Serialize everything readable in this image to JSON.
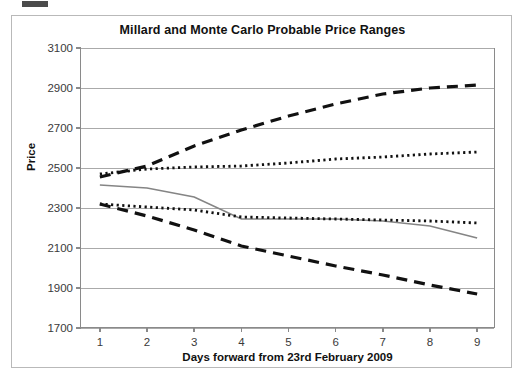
{
  "chart_data": {
    "type": "line",
    "title": "Millard and Monte Carlo Probable Price Ranges",
    "xlabel": "Days forward from 23rd February 2009",
    "ylabel": "Price",
    "x": [
      1,
      2,
      3,
      4,
      5,
      6,
      7,
      8,
      9
    ],
    "xlim": [
      0.6,
      9.4
    ],
    "ylim": [
      1700,
      3100
    ],
    "xticks": [
      "1",
      "2",
      "3",
      "4",
      "5",
      "6",
      "7",
      "8",
      "9"
    ],
    "yticks": [
      "1700",
      "1900",
      "2100",
      "2300",
      "2500",
      "2700",
      "2900",
      "3100"
    ],
    "grid": "horizontal",
    "legend": "none",
    "series": [
      {
        "name": "Monte Carlo upper bound",
        "style": "dashed",
        "color": "#111111",
        "values": [
          2455,
          2510,
          2610,
          2690,
          2760,
          2820,
          2870,
          2900,
          2915
        ]
      },
      {
        "name": "Millard upper bound",
        "style": "dotted",
        "color": "#111111",
        "values": [
          2470,
          2495,
          2505,
          2510,
          2525,
          2545,
          2555,
          2570,
          2580
        ]
      },
      {
        "name": "Actual price",
        "style": "solid",
        "color": "#858585",
        "values": [
          2415,
          2400,
          2355,
          2245,
          2245,
          2245,
          2235,
          2210,
          2150
        ]
      },
      {
        "name": "Millard lower bound",
        "style": "dotted",
        "color": "#111111",
        "values": [
          2320,
          2305,
          2290,
          2255,
          2250,
          2245,
          2240,
          2235,
          2225
        ]
      },
      {
        "name": "Monte Carlo lower bound",
        "style": "dashed",
        "color": "#111111",
        "values": [
          2320,
          2260,
          2190,
          2110,
          2060,
          2010,
          1965,
          1915,
          1870
        ]
      }
    ]
  }
}
